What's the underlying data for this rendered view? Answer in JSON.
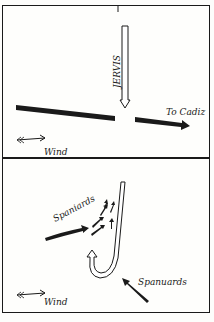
{
  "top_panel": {
    "labels": {
      "jervis": "JERVIS",
      "to_cadiz": "To Cadiz",
      "wind": "Wind"
    }
  },
  "bottom_panel": {
    "labels": {
      "spaniards_upper": "Spaniards",
      "spaniards_lower": "Spanuards",
      "wind": "Wind"
    }
  },
  "colors": {
    "ink": "#1a1a1a",
    "paper": "#fefefc"
  }
}
